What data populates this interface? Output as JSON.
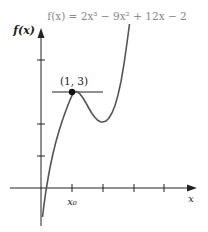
{
  "diagram": {
    "equation": "f(x) = 2x³ − 9x² + 12x − 2",
    "y_axis_label": "f(x)",
    "x_axis_label": "x",
    "point_label": "(1, 3)",
    "x_tick_label": "x₀",
    "point": {
      "x": 1,
      "y": 3
    },
    "tangent": "horizontal tangent at (1, 3)",
    "colors": {
      "curve": "#555555",
      "axes": "#222222",
      "equation": "#888888"
    }
  }
}
